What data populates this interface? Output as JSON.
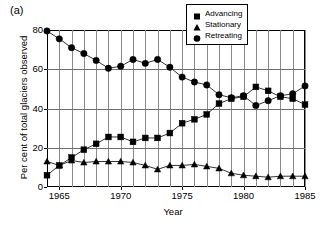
{
  "panel": {
    "label": "(a)"
  },
  "chart_data": {
    "type": "line",
    "title": "",
    "subtitle": "",
    "xlabel": "Year",
    "ylabel": "Per cent of total glaciers observed",
    "xlim": [
      1964,
      1985
    ],
    "ylim": [
      0,
      80
    ],
    "yticks": [
      0,
      20,
      40,
      60,
      80
    ],
    "xticks": [
      1965,
      1970,
      1975,
      1980,
      1985
    ],
    "grid": "both",
    "legend_position": "top-right",
    "x": [
      1964,
      1965,
      1966,
      1967,
      1968,
      1969,
      1970,
      1971,
      1972,
      1973,
      1974,
      1975,
      1976,
      1977,
      1978,
      1979,
      1980,
      1981,
      1982,
      1983,
      1984,
      1985
    ],
    "series": [
      {
        "name": "Advancing",
        "marker": "square",
        "values": [
          6,
          11,
          15,
          19,
          22,
          25.5,
          25.5,
          23,
          25,
          25,
          27.5,
          32.5,
          34.5,
          37,
          42.5,
          45,
          46,
          51,
          49,
          46,
          45,
          42
        ]
      },
      {
        "name": "Stationary",
        "marker": "triangle",
        "values": [
          13,
          11,
          13.5,
          12.5,
          13,
          13,
          13,
          12.5,
          11,
          9,
          11,
          11,
          11.5,
          10.5,
          9.5,
          7,
          6,
          5.5,
          5,
          5.5,
          5.5,
          5.5
        ]
      },
      {
        "name": "Retreating",
        "marker": "circle",
        "values": [
          79.5,
          75.5,
          71,
          68,
          64.5,
          60.5,
          61.5,
          65,
          63,
          65,
          61,
          56,
          53.5,
          52,
          47,
          45.5,
          46.5,
          41.5,
          44,
          46.5,
          47.5,
          51.5
        ]
      }
    ]
  },
  "ytick_labels": [
    "0",
    "20",
    "40",
    "60",
    "80"
  ],
  "xtick_labels": [
    "1965",
    "1970",
    "1975",
    "1980",
    "1985"
  ],
  "legend": {
    "items": [
      {
        "label": "Advancing",
        "marker": "square-marker"
      },
      {
        "label": "Stationary",
        "marker": "triangle-marker"
      },
      {
        "label": "Retreating",
        "marker": "circle-marker"
      }
    ]
  },
  "colors": {
    "series": "#000000",
    "grid": "#7f7f7f",
    "frame": "#000000",
    "background": "#ffffff"
  }
}
